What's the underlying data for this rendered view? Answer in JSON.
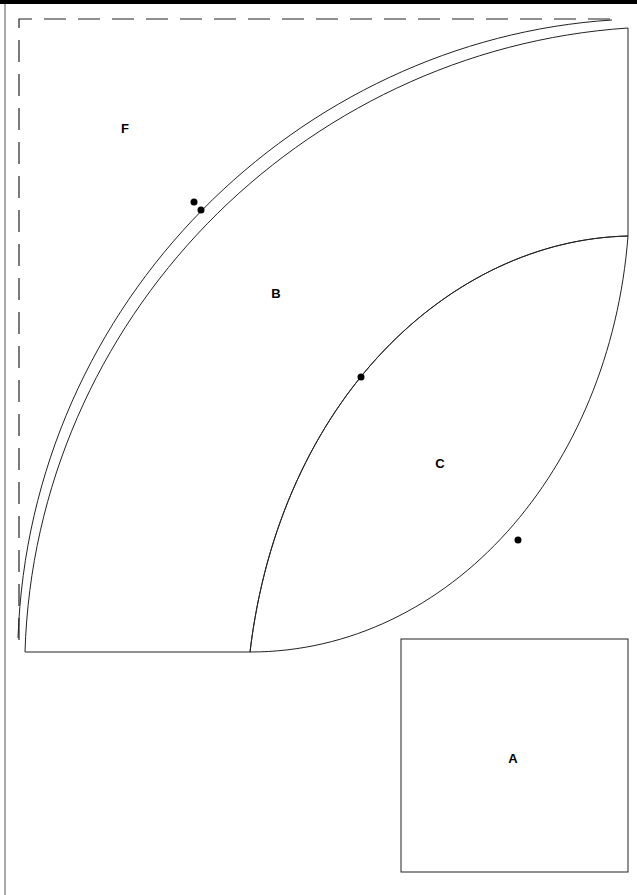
{
  "document": {
    "type": "quilt-pattern-template",
    "pieces": [
      {
        "id": "A",
        "label": "A",
        "shape": "square",
        "x": 508,
        "y": 758
      },
      {
        "id": "B",
        "label": "B",
        "shape": "quarter-arc-band",
        "x": 276,
        "y": 293
      },
      {
        "id": "C",
        "label": "C",
        "shape": "lens / melon",
        "x": 440,
        "y": 463
      },
      {
        "id": "F",
        "label": "F",
        "shape": "corner background",
        "x": 125,
        "y": 128
      }
    ],
    "registration_marks": 4,
    "line_color": "#000000",
    "background_color": "#ffffff"
  }
}
